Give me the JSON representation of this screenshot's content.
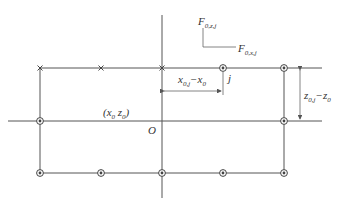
{
  "diagram": {
    "labels": {
      "force_z": {
        "main": "F",
        "sub": "0,z,j"
      },
      "force_x": {
        "main": "F",
        "sub": "0,x,j"
      },
      "point_j": "j",
      "origin": "O",
      "center": "(x",
      "center_sub0": "0",
      "center_z": " z",
      "center_sub1": "0",
      "center_close": ")",
      "dx": {
        "a": "x",
        "a_sub": "0,j",
        "b": "−x",
        "b_sub": "0"
      },
      "dz": {
        "a": "z",
        "a_sub": "0,j",
        "b": "−z",
        "b_sub": "0"
      }
    },
    "marker_types": {
      "cross": "×",
      "circle_cross": "⊗"
    },
    "colors": {
      "line": "#555555",
      "text": "#333333",
      "background": "#ffffff"
    }
  }
}
